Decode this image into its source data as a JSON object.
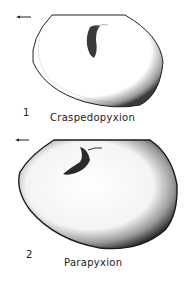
{
  "figures": [
    {
      "number": "1",
      "caption": "Craspedopyxion",
      "orientation_arrow": "arrow-left"
    },
    {
      "number": "2",
      "caption": "Parapyxion",
      "orientation_arrow": "arrow-left"
    }
  ],
  "colors": {
    "ink": "#1a1a1a",
    "background": "#ffffff"
  }
}
